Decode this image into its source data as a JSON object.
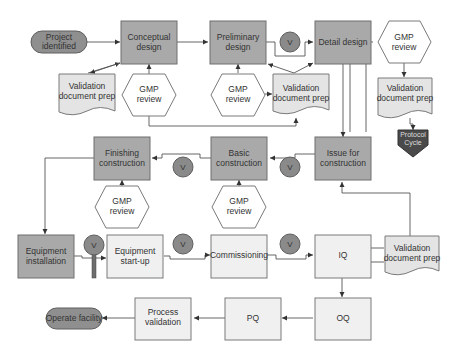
{
  "diagram": {
    "colors": {
      "design_box": "#a9a9a9",
      "execution_box": "#f0f0f0",
      "document": "#e4e4e4",
      "terminator": "#8f8f8f",
      "verification_circle": "#8a8a8a",
      "protocol": "#4a4a4a"
    },
    "nodes": {
      "project_identified": [
        "Project",
        "identified"
      ],
      "conceptual_design": [
        "Conceptual",
        "design"
      ],
      "preliminary_design": [
        "Preliminary",
        "design"
      ],
      "detail_design": "Detail design",
      "gmp_review_1": [
        "GMP",
        "review"
      ],
      "gmp_review_2": [
        "GMP",
        "review"
      ],
      "gmp_review_3": [
        "GMP",
        "review"
      ],
      "gmp_review_4": [
        "GMP",
        "review"
      ],
      "gmp_review_5": [
        "GMP",
        "review"
      ],
      "validation_doc_1": [
        "Validation",
        "document prep"
      ],
      "validation_doc_2": [
        "Validation",
        "document prep"
      ],
      "validation_doc_3": [
        "Validation",
        "document prep"
      ],
      "validation_doc_4": [
        "Validation",
        "document prep"
      ],
      "protocol_cycle": [
        "Protocol",
        "Cycle"
      ],
      "issue_for_construction": [
        "Issue for",
        "construction"
      ],
      "basic_construction": [
        "Basic",
        "construction"
      ],
      "finishing_construction": [
        "Finishing",
        "construction"
      ],
      "equipment_installation": [
        "Equipment",
        "installation"
      ],
      "equipment_startup": [
        "Equipment",
        "start-up"
      ],
      "commissioning": "Commissioning",
      "iq": "IQ",
      "oq": "OQ",
      "pq": "PQ",
      "process_validation": [
        "Process",
        "validation"
      ],
      "operate_facility": "Operate facility",
      "verification_label": "V"
    }
  }
}
